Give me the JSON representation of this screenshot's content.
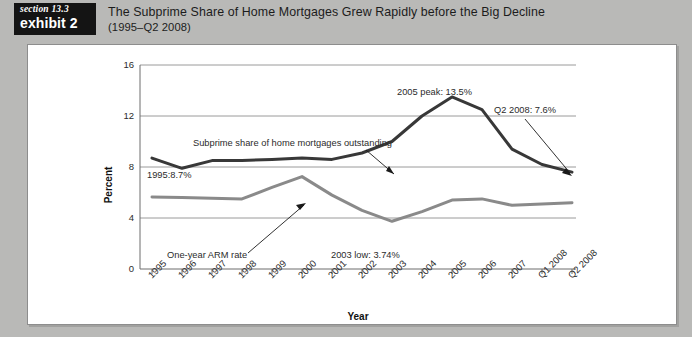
{
  "header": {
    "badge_section": "section 13.3",
    "badge_exhibit": "exhibit 2",
    "title_line1": "The Subprime Share of Home Mortgages Grew Rapidly before the Big Decline",
    "title_line2": "(1995–Q2 2008)"
  },
  "colors": {
    "page_background": "#b9b9b7",
    "panel_background": "#ffffff",
    "badge_background": "#141414",
    "subprime_line": "#383838",
    "arm_line": "#8a8a8a",
    "gridline": "#9a9a9a",
    "text": "#2b2b2b"
  },
  "chart_data": {
    "type": "line",
    "title": "The Subprime Share of Home Mortgages Grew Rapidly before the Big Decline (1995–Q2 2008)",
    "xlabel": "Year",
    "ylabel": "Percent",
    "ylim": [
      0,
      16
    ],
    "yticks": [
      "0",
      "4",
      "8",
      "12",
      "16"
    ],
    "ytick_values": [
      0,
      4,
      8,
      12,
      16
    ],
    "grid": "horizontal",
    "legend": "none",
    "categories": [
      "1995",
      "1996",
      "1997",
      "1998",
      "1999",
      "2000",
      "2001",
      "2002",
      "2003",
      "2004",
      "2005",
      "2006",
      "2007",
      "Q1 2008",
      "Q2 2008"
    ],
    "series": [
      {
        "name": "Subprime share of home mortgages outstanding",
        "color": "#383838",
        "values": [
          8.7,
          7.9,
          8.5,
          8.5,
          8.6,
          8.7,
          8.6,
          9.1,
          10.0,
          12.0,
          13.5,
          12.5,
          9.4,
          8.2,
          7.6
        ]
      },
      {
        "name": "One-year ARM rate",
        "color": "#8a8a8a",
        "values": [
          5.65,
          5.6,
          5.55,
          5.5,
          6.4,
          7.25,
          5.8,
          4.6,
          3.74,
          4.5,
          5.4,
          5.5,
          5.0,
          5.1,
          5.2
        ]
      }
    ],
    "annotations": [
      {
        "text": "Subprime share of home mortgages outstanding",
        "points_to": "2003",
        "value": 10.0
      },
      {
        "text": "1995:8.7%",
        "points_to": "1995",
        "value": 8.7
      },
      {
        "text": "2005 peak: 13.5%",
        "points_to": "2005",
        "value": 13.5
      },
      {
        "text": "Q2 2008: 7.6%",
        "points_to": "Q2 2008",
        "value": 7.6
      },
      {
        "text": "One-year ARM rate",
        "points_to": "2000",
        "value": 7.25
      },
      {
        "text": "2003 low: 3.74%",
        "points_to": "2003",
        "value": 3.74
      }
    ]
  }
}
